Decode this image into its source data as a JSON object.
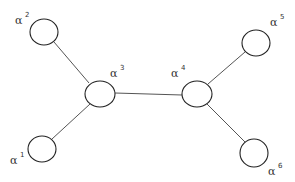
{
  "diagram": {
    "type": "graph",
    "nodes": [
      {
        "id": "a1",
        "symbol": "α",
        "sup": "1",
        "cx": 42,
        "cy": 149,
        "rx": 14,
        "ry": 13,
        "lx": 10,
        "ly": 164,
        "sx": 20,
        "sy": 157
      },
      {
        "id": "a2",
        "symbol": "α",
        "sup": "2",
        "cx": 44,
        "cy": 32,
        "rx": 14,
        "ry": 13,
        "lx": 15,
        "ly": 24,
        "sx": 25,
        "sy": 17
      },
      {
        "id": "a3",
        "symbol": "α",
        "sup": "3",
        "cx": 100,
        "cy": 94,
        "rx": 15,
        "ry": 13,
        "lx": 110,
        "ly": 77,
        "sx": 120,
        "sy": 70
      },
      {
        "id": "a4",
        "symbol": "α",
        "sup": "4",
        "cx": 197,
        "cy": 94,
        "rx": 15,
        "ry": 13,
        "lx": 171,
        "ly": 77,
        "sx": 181,
        "sy": 70
      },
      {
        "id": "a5",
        "symbol": "α",
        "sup": "5",
        "cx": 256,
        "cy": 43,
        "rx": 14,
        "ry": 13,
        "lx": 270,
        "ly": 26,
        "sx": 280,
        "sy": 19
      },
      {
        "id": "a6",
        "symbol": "α",
        "sup": "6",
        "cx": 254,
        "cy": 153,
        "rx": 14,
        "ry": 14,
        "lx": 268,
        "ly": 175,
        "sx": 278,
        "sy": 168
      }
    ],
    "edges": [
      {
        "from": "a2",
        "to": "a3",
        "x1": 54,
        "y1": 42,
        "x2": 89,
        "y2": 83
      },
      {
        "from": "a1",
        "to": "a3",
        "x1": 52,
        "y1": 139,
        "x2": 90,
        "y2": 104
      },
      {
        "from": "a3",
        "to": "a4",
        "x1": 115,
        "y1": 93,
        "x2": 182,
        "y2": 95
      },
      {
        "from": "a4",
        "to": "a5",
        "x1": 208,
        "y1": 84,
        "x2": 245,
        "y2": 52
      },
      {
        "from": "a4",
        "to": "a6",
        "x1": 207,
        "y1": 104,
        "x2": 245,
        "y2": 142
      }
    ]
  }
}
